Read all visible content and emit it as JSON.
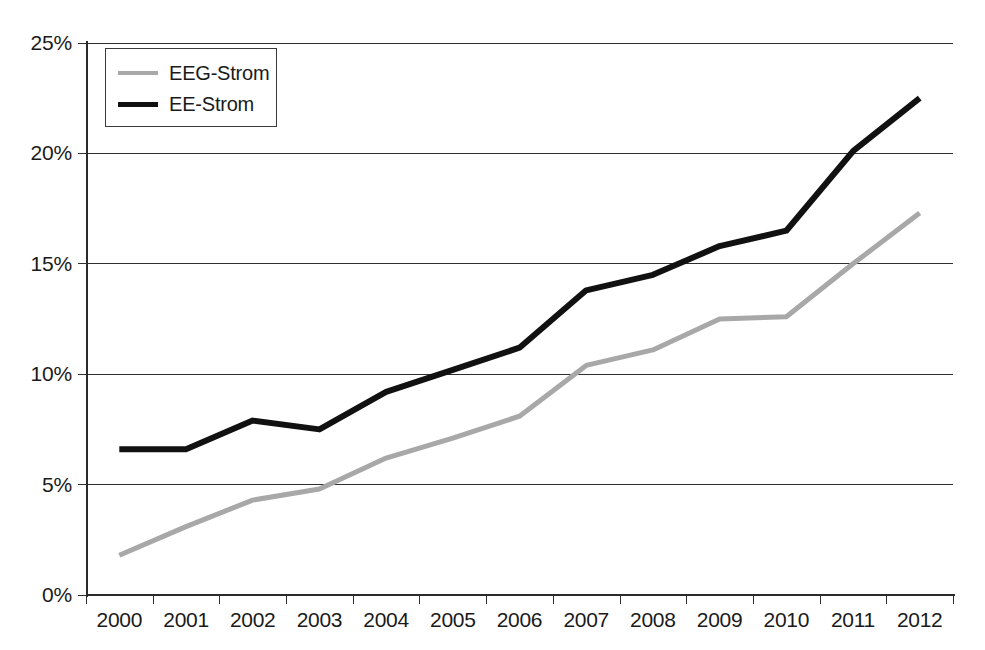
{
  "chart_data": {
    "type": "line",
    "title": "",
    "subtitle": "",
    "xlabel": "",
    "ylabel": "",
    "categories": [
      "2000",
      "2001",
      "2002",
      "2003",
      "2004",
      "2005",
      "2006",
      "2007",
      "2008",
      "2009",
      "2010",
      "2011",
      "2012"
    ],
    "x": [
      2000,
      2001,
      2002,
      2003,
      2004,
      2005,
      2006,
      2007,
      2008,
      2009,
      2010,
      2011,
      2012
    ],
    "series": [
      {
        "name": "EEG-Strom",
        "color": "#a8a8a8",
        "values": [
          1.8,
          3.1,
          4.3,
          4.8,
          6.2,
          7.1,
          8.1,
          10.4,
          11.1,
          12.5,
          12.6,
          15.0,
          17.3
        ]
      },
      {
        "name": "EE-Strom",
        "color": "#111111",
        "values": [
          6.6,
          6.6,
          7.9,
          7.5,
          9.2,
          10.2,
          11.2,
          13.8,
          14.5,
          15.8,
          16.5,
          20.1,
          22.5
        ]
      }
    ],
    "ylim": [
      0,
      25
    ],
    "yticks": [
      0,
      5,
      10,
      15,
      20,
      25
    ],
    "ytick_labels": [
      "0%",
      "5%",
      "10%",
      "15%",
      "20%",
      "25%"
    ],
    "grid": true,
    "grid_axis": "y",
    "legend_position": "top-left",
    "legend_entries": [
      "EEG-Strom",
      "EE-Strom"
    ],
    "value_unit": "%",
    "background_color": "#ffffff",
    "axis_color": "#2b2b2b",
    "grid_color": "#2f2f2f"
  }
}
